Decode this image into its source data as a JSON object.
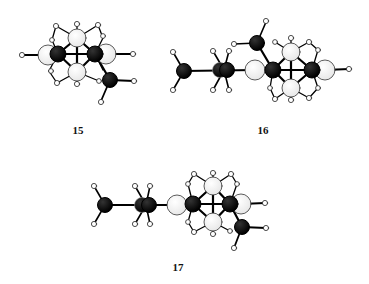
{
  "figure": {
    "molecules": [
      {
        "id": "15",
        "label": "15",
        "label_pos": [
          78,
          126
        ]
      },
      {
        "id": "16",
        "label": "16",
        "label_pos": [
          263,
          126
        ]
      },
      {
        "id": "17",
        "label": "17",
        "label_pos": [
          178,
          263
        ]
      }
    ],
    "colors": {
      "carbon": "#000000",
      "cage_atom": "#ffffff",
      "hydrogen": "#ffffff",
      "bond": "#000000",
      "outline": "#222222"
    }
  }
}
